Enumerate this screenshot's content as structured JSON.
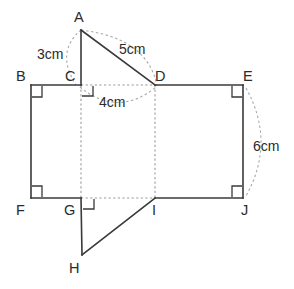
{
  "figure": {
    "canvas": {
      "width": 294,
      "height": 289
    },
    "stroke_colors": {
      "solid": "#3a3a3a",
      "dashed": "#9a9a9a",
      "arc": "#a8a8a8",
      "text": "#2b2b2b",
      "background": "#ffffff"
    },
    "vertices": [
      {
        "id": "A",
        "label": "A",
        "x": 81,
        "y": 30,
        "label_x": 74,
        "label_y": 10
      },
      {
        "id": "B",
        "label": "B",
        "x": 31,
        "y": 85,
        "label_x": 16,
        "label_y": 69
      },
      {
        "id": "C",
        "label": "C",
        "x": 81,
        "y": 85,
        "label_x": 65,
        "label_y": 69
      },
      {
        "id": "D",
        "label": "D",
        "x": 155,
        "y": 85,
        "label_x": 155,
        "label_y": 69
      },
      {
        "id": "E",
        "label": "E",
        "x": 243,
        "y": 85,
        "label_x": 243,
        "label_y": 69
      },
      {
        "id": "F",
        "label": "F",
        "x": 31,
        "y": 198,
        "label_x": 16,
        "label_y": 203
      },
      {
        "id": "G",
        "label": "G",
        "x": 81,
        "y": 198,
        "label_x": 64,
        "label_y": 203
      },
      {
        "id": "H",
        "label": "H",
        "x": 82,
        "y": 255,
        "label_x": 69,
        "label_y": 261
      },
      {
        "id": "I",
        "label": "I",
        "x": 155,
        "y": 198,
        "label_x": 152,
        "label_y": 203
      },
      {
        "id": "J",
        "label": "J",
        "x": 243,
        "y": 198,
        "label_x": 241,
        "label_y": 203
      }
    ],
    "solid_edges": [
      {
        "name": "edge-A-C",
        "from": "A",
        "to": "C"
      },
      {
        "name": "edge-A-D",
        "from": "A",
        "to": "D"
      },
      {
        "name": "edge-B-C",
        "from": "B",
        "to": "C"
      },
      {
        "name": "edge-D-E",
        "from": "D",
        "to": "E"
      },
      {
        "name": "edge-B-F",
        "from": "B",
        "to": "F"
      },
      {
        "name": "edge-E-J",
        "from": "E",
        "to": "J"
      },
      {
        "name": "edge-F-G",
        "from": "F",
        "to": "G"
      },
      {
        "name": "edge-I-J",
        "from": "I",
        "to": "J"
      },
      {
        "name": "edge-G-H",
        "from": "G",
        "to": "H"
      },
      {
        "name": "edge-H-I",
        "from": "H",
        "to": "I"
      }
    ],
    "dashed_edges": [
      {
        "name": "edge-C-D",
        "from": "C",
        "to": "D"
      },
      {
        "name": "edge-G-I",
        "from": "G",
        "to": "I"
      },
      {
        "name": "edge-C-G",
        "from": "C",
        "to": "G"
      },
      {
        "name": "edge-D-I",
        "from": "D",
        "to": "I"
      }
    ],
    "dimension_labels": [
      {
        "id": "dim-3cm",
        "text": "3cm",
        "x": 37,
        "y": 47,
        "measures": "A-C"
      },
      {
        "id": "dim-5cm",
        "text": "5cm",
        "x": 119,
        "y": 42,
        "measures": "A-D"
      },
      {
        "id": "dim-4cm",
        "text": "4cm",
        "x": 99,
        "y": 95,
        "measures": "C-D"
      },
      {
        "id": "dim-6cm",
        "text": "6cm",
        "x": 253,
        "y": 139,
        "measures": "E-J"
      }
    ],
    "dimension_arcs": [
      {
        "id": "arc-3cm",
        "path": "M 81 30 Q 55 52 76 85"
      },
      {
        "id": "arc-5cm",
        "path": "M 81 30 Q 148 38 157 86"
      },
      {
        "id": "arc-4cm",
        "path": "M 80 87 Q 118 118 156 87"
      },
      {
        "id": "arc-6cm",
        "path": "M 246 88 Q 276 142 246 196"
      }
    ],
    "right_angle_marks": [
      {
        "id": "right-angle-C",
        "at": "C",
        "path": "M 82 96 L 93 96 L 93 86"
      },
      {
        "id": "right-angle-B",
        "at": "B",
        "path": "M 42 86 L 42 97 L 32 97"
      },
      {
        "id": "right-angle-E",
        "at": "E",
        "path": "M 232 86 L 232 97 L 242 97"
      },
      {
        "id": "right-angle-F",
        "at": "F",
        "path": "M 42 197 L 42 186 L 32 186"
      },
      {
        "id": "right-angle-J",
        "at": "J",
        "path": "M 232 197 L 232 186 L 242 186"
      },
      {
        "id": "right-angle-G",
        "at": "G",
        "path": "M 83 209 L 94 209 L 94 199"
      }
    ]
  }
}
